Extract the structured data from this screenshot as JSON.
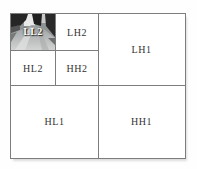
{
  "figure": {
    "description_name": "wavelet-decomposition-subband-diagram"
  },
  "subbands": {
    "ll2": "LL2",
    "lh2": "LH2",
    "hl2": "HL2",
    "hh2": "HH2",
    "lh1": "LH1",
    "hl1": "HL1",
    "hh1": "HH1"
  },
  "thumbnail": {
    "icon": "road-scene-image",
    "overlay_label": "LL2"
  },
  "colors": {
    "background": "#ffffff",
    "grid_line": "#7d7d7d",
    "label_text": "#333333",
    "ll2_overlay_text": "#ffffff"
  }
}
